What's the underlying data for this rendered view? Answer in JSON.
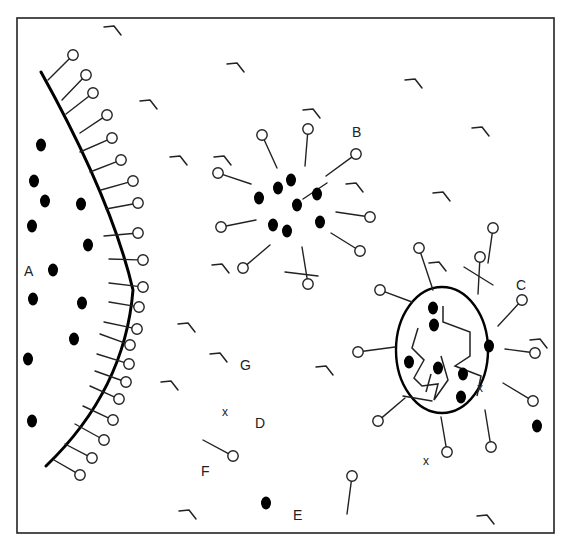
{
  "diagram": {
    "frame": {
      "x": 17,
      "y": 18,
      "w": 537,
      "h": 515
    },
    "colors": {
      "ink": "#222222",
      "fill": "#000000",
      "paper": "#ffffff"
    },
    "labels": [
      {
        "text": "A",
        "x": 24,
        "y": 276
      },
      {
        "text": "B",
        "x": 352,
        "y": 137
      },
      {
        "text": "C",
        "x": 516,
        "y": 290
      },
      {
        "text": "G",
        "x": 240,
        "y": 370
      },
      {
        "text": "D",
        "x": 255,
        "y": 428
      },
      {
        "text": "F",
        "x": 201,
        "y": 476
      },
      {
        "text": "E",
        "x": 293,
        "y": 520
      }
    ],
    "x_marks": [
      {
        "text": "x",
        "x": 222,
        "y": 416
      },
      {
        "text": "x",
        "x": 477,
        "y": 392
      },
      {
        "text": "x",
        "x": 423,
        "y": 465
      }
    ],
    "membrane_A": {
      "path": "M41,72 Q112,200 133,290 Q125,390 46,466",
      "lipids": [
        {
          "x1": 48,
          "y1": 80,
          "x2": 73,
          "y2": 55
        },
        {
          "x1": 62,
          "y1": 100,
          "x2": 86,
          "y2": 75
        },
        {
          "x1": 66,
          "y1": 114,
          "x2": 93,
          "y2": 93
        },
        {
          "x1": 80,
          "y1": 133,
          "x2": 107,
          "y2": 115
        },
        {
          "x1": 80,
          "y1": 152,
          "x2": 112,
          "y2": 138
        },
        {
          "x1": 90,
          "y1": 172,
          "x2": 121,
          "y2": 160
        },
        {
          "x1": 101,
          "y1": 190,
          "x2": 133,
          "y2": 181
        },
        {
          "x1": 106,
          "y1": 209,
          "x2": 138,
          "y2": 203
        },
        {
          "x1": 104,
          "y1": 236,
          "x2": 138,
          "y2": 233
        },
        {
          "x1": 109,
          "y1": 259,
          "x2": 143,
          "y2": 260
        },
        {
          "x1": 109,
          "y1": 283,
          "x2": 143,
          "y2": 287
        },
        {
          "x1": 109,
          "y1": 302,
          "x2": 139,
          "y2": 307
        },
        {
          "x1": 104,
          "y1": 322,
          "x2": 137,
          "y2": 329
        },
        {
          "x1": 100,
          "y1": 334,
          "x2": 130,
          "y2": 345
        },
        {
          "x1": 97,
          "y1": 354,
          "x2": 129,
          "y2": 364
        },
        {
          "x1": 95,
          "y1": 371,
          "x2": 126,
          "y2": 382
        },
        {
          "x1": 90,
          "y1": 386,
          "x2": 119,
          "y2": 399
        },
        {
          "x1": 83,
          "y1": 406,
          "x2": 113,
          "y2": 420
        },
        {
          "x1": 75,
          "y1": 424,
          "x2": 104,
          "y2": 440
        },
        {
          "x1": 65,
          "y1": 444,
          "x2": 92,
          "y2": 458
        },
        {
          "x1": 54,
          "y1": 460,
          "x2": 80,
          "y2": 475
        }
      ],
      "dots": [
        {
          "x": 41,
          "y": 145
        },
        {
          "x": 34,
          "y": 181
        },
        {
          "x": 45,
          "y": 201
        },
        {
          "x": 32,
          "y": 226
        },
        {
          "x": 81,
          "y": 204
        },
        {
          "x": 88,
          "y": 245
        },
        {
          "x": 53,
          "y": 270
        },
        {
          "x": 33,
          "y": 299
        },
        {
          "x": 82,
          "y": 303
        },
        {
          "x": 74,
          "y": 339
        },
        {
          "x": 28,
          "y": 359
        },
        {
          "x": 32,
          "y": 421
        }
      ]
    },
    "micelle_B": {
      "lipids": [
        {
          "x1": 277,
          "y1": 168,
          "x2": 262,
          "y2": 135
        },
        {
          "x1": 305,
          "y1": 166,
          "x2": 308,
          "y2": 129
        },
        {
          "x1": 326,
          "y1": 176,
          "x2": 356,
          "y2": 154
        },
        {
          "x1": 251,
          "y1": 184,
          "x2": 218,
          "y2": 173
        },
        {
          "x1": 256,
          "y1": 220,
          "x2": 221,
          "y2": 227
        },
        {
          "x1": 336,
          "y1": 212,
          "x2": 370,
          "y2": 217
        },
        {
          "x1": 331,
          "y1": 233,
          "x2": 360,
          "y2": 251
        },
        {
          "x1": 270,
          "y1": 245,
          "x2": 243,
          "y2": 268
        },
        {
          "x1": 302,
          "y1": 247,
          "x2": 308,
          "y2": 284
        }
      ],
      "extra_strokes": [
        {
          "x1": 303,
          "y1": 199,
          "x2": 327,
          "y2": 183
        },
        {
          "x1": 285,
          "y1": 272,
          "x2": 318,
          "y2": 276
        }
      ],
      "dots": [
        {
          "x": 259,
          "y": 198
        },
        {
          "x": 278,
          "y": 188
        },
        {
          "x": 291,
          "y": 180
        },
        {
          "x": 297,
          "y": 205
        },
        {
          "x": 273,
          "y": 225
        },
        {
          "x": 287,
          "y": 231
        },
        {
          "x": 317,
          "y": 194
        },
        {
          "x": 320,
          "y": 222
        }
      ]
    },
    "vesicle_C": {
      "ellipse": {
        "cx": 442,
        "cy": 350,
        "rx": 46,
        "ry": 63
      },
      "lipids": [
        {
          "x1": 433,
          "y1": 290,
          "x2": 419,
          "y2": 248
        },
        {
          "x1": 478,
          "y1": 294,
          "x2": 480,
          "y2": 257
        },
        {
          "x1": 412,
          "y1": 302,
          "x2": 380,
          "y2": 290
        },
        {
          "x1": 498,
          "y1": 326,
          "x2": 522,
          "y2": 300
        },
        {
          "x1": 395,
          "y1": 347,
          "x2": 358,
          "y2": 352
        },
        {
          "x1": 505,
          "y1": 349,
          "x2": 535,
          "y2": 353
        },
        {
          "x1": 503,
          "y1": 383,
          "x2": 533,
          "y2": 401
        },
        {
          "x1": 405,
          "y1": 398,
          "x2": 378,
          "y2": 421
        },
        {
          "x1": 441,
          "y1": 417,
          "x2": 447,
          "y2": 452
        },
        {
          "x1": 485,
          "y1": 410,
          "x2": 491,
          "y2": 447
        }
      ],
      "extra_strokes": [
        {
          "x1": 464,
          "y1": 267,
          "x2": 493,
          "y2": 285
        },
        {
          "x1": 403,
          "y1": 396,
          "x2": 432,
          "y2": 401
        }
      ],
      "chains": [
        "M443,306 L443,322 L470,332 L470,356 L455,366 L481,376 L477,396",
        "M418,328 L412,348 L424,360 L414,378 L422,386 L438,384 L434,400 L448,380 L441,356",
        "M431,374 L426,392"
      ],
      "dots": [
        {
          "x": 433,
          "y": 308
        },
        {
          "x": 434,
          "y": 325
        },
        {
          "x": 409,
          "y": 362
        },
        {
          "x": 438,
          "y": 368
        },
        {
          "x": 463,
          "y": 374
        },
        {
          "x": 461,
          "y": 397
        },
        {
          "x": 489,
          "y": 346
        }
      ]
    },
    "free_lipids": [
      {
        "x1": 203,
        "y1": 440,
        "x2": 233,
        "y2": 456,
        "label": "F"
      },
      {
        "x1": 347,
        "y1": 514,
        "x2": 352,
        "y2": 476
      },
      {
        "x1": 488,
        "y1": 263,
        "x2": 493,
        "y2": 228
      }
    ],
    "free_dots": [
      {
        "x": 266,
        "y": 503,
        "label": "E"
      },
      {
        "x": 537,
        "y": 426
      }
    ],
    "monomers": [
      {
        "x": 104,
        "y": 27
      },
      {
        "x": 227,
        "y": 64
      },
      {
        "x": 140,
        "y": 101
      },
      {
        "x": 405,
        "y": 80
      },
      {
        "x": 303,
        "y": 110
      },
      {
        "x": 472,
        "y": 128
      },
      {
        "x": 170,
        "y": 157
      },
      {
        "x": 214,
        "y": 157
      },
      {
        "x": 433,
        "y": 193
      },
      {
        "x": 346,
        "y": 184
      },
      {
        "x": 212,
        "y": 265
      },
      {
        "x": 429,
        "y": 263
      },
      {
        "x": 178,
        "y": 324
      },
      {
        "x": 210,
        "y": 354
      },
      {
        "x": 316,
        "y": 367
      },
      {
        "x": 161,
        "y": 382
      },
      {
        "x": 530,
        "y": 340
      },
      {
        "x": 179,
        "y": 511
      },
      {
        "x": 477,
        "y": 516
      }
    ]
  }
}
